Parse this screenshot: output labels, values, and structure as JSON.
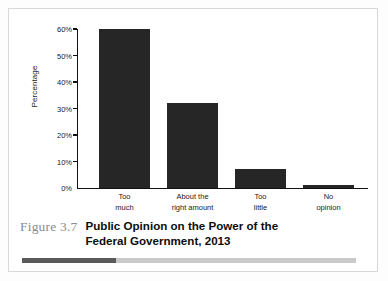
{
  "figure": {
    "number_label": "Figure 3.7",
    "title_line_1": "Public Opinion on the Power of the",
    "title_line_2": "Federal Government, 2013"
  },
  "colors": {
    "bar": "#262626",
    "axis": "#111111",
    "figure_number": "#8c8c8c",
    "rule_dark": "#5a5a5a",
    "rule_light": "#c9c9c9",
    "frame": "#d8d8d8"
  },
  "chart_data": {
    "type": "bar",
    "title": "Public Opinion on the Power of the Federal Government, 2013",
    "xlabel": "",
    "ylabel": "Percentage",
    "ylim": [
      0,
      60
    ],
    "grid": false,
    "legend": "none",
    "categories": [
      "Too much",
      "About the right amount",
      "Too little",
      "No opinion"
    ],
    "category_lines": [
      [
        "Too",
        "much"
      ],
      [
        "About the",
        "right amount"
      ],
      [
        "Too",
        "little"
      ],
      [
        "No",
        "opinion"
      ]
    ],
    "values": [
      60,
      32,
      7,
      1
    ],
    "value_labels": [
      "60%",
      "32%",
      "7%",
      "1%"
    ],
    "y_ticks": [
      0,
      10,
      20,
      30,
      40,
      50,
      60
    ],
    "y_tick_labels": [
      "0%",
      "10%",
      "20%",
      "30%",
      "40%",
      "50%",
      "60%"
    ]
  }
}
